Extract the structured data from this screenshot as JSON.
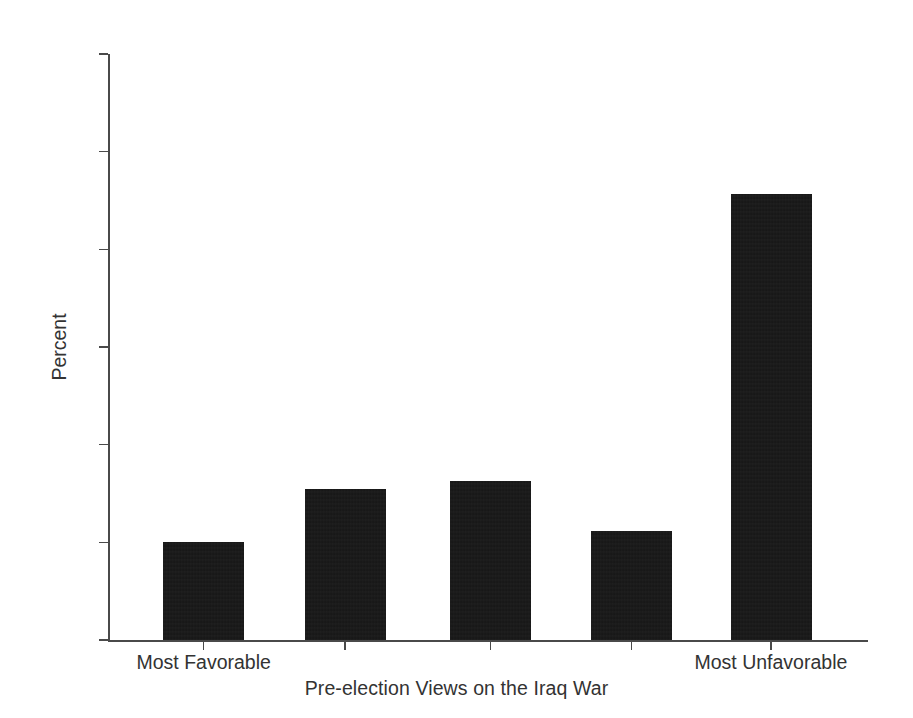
{
  "chart_data": {
    "type": "bar",
    "title": "",
    "xlabel": "Pre-election Views on the Iraq War",
    "ylabel": "Percent",
    "categories": [
      "Most Favorable",
      "2",
      "3",
      "4",
      "Most Unfavorable"
    ],
    "visible_category_labels": [
      "Most Favorable",
      "",
      "",
      "",
      "Most Unfavorable"
    ],
    "values": [
      10.0,
      15.5,
      16.3,
      11.2,
      45.7
    ],
    "ylim": [
      0,
      60
    ],
    "yticks": [
      0,
      10,
      20,
      30,
      40,
      50,
      60
    ],
    "ytick_labels": [
      "0",
      "10",
      "20",
      "30",
      "40",
      "50",
      "60"
    ],
    "grid": false,
    "legend": null,
    "bar_color": "#151515",
    "axis_color": "#4a4a4a",
    "background_color": "#ffffff"
  },
  "axes": {
    "y_title": "Percent",
    "x_title": "Pre-election Views on the Iraq War",
    "y_ticks": [
      {
        "label": "60",
        "value": 60
      },
      {
        "label": "50",
        "value": 50
      },
      {
        "label": "40",
        "value": 40
      },
      {
        "label": "30",
        "value": 30
      },
      {
        "label": "20",
        "value": 20
      },
      {
        "label": "10",
        "value": 10
      },
      {
        "label": "0",
        "value": 0
      }
    ]
  },
  "bars": [
    {
      "label": "Most Favorable",
      "value": 10.0,
      "show_label": true
    },
    {
      "label": "",
      "value": 15.5,
      "show_label": false
    },
    {
      "label": "",
      "value": 16.3,
      "show_label": false
    },
    {
      "label": "",
      "value": 11.2,
      "show_label": false
    },
    {
      "label": "Most Unfavorable",
      "value": 45.7,
      "show_label": true
    }
  ]
}
